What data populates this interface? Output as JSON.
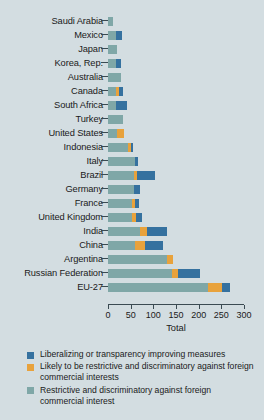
{
  "chart_data": {
    "type": "bar",
    "orientation": "horizontal",
    "stacked": true,
    "title": "",
    "xlabel": "Total",
    "ylabel": "",
    "xlim": [
      0,
      300
    ],
    "xticks": [
      0,
      50,
      100,
      150,
      200,
      250,
      300
    ],
    "grid": false,
    "legend_position": "bottom-left",
    "categories": [
      "Saudi Arabia",
      "Mexico",
      "Japan",
      "Korea, Rep.",
      "Australia",
      "Canada",
      "South Africa",
      "Turkey",
      "United States",
      "Indonesia",
      "Italy",
      "Brazil",
      "Germany",
      "France",
      "United Kingdom",
      "India",
      "China",
      "Argentina",
      "Russian Federation",
      "EU-27"
    ],
    "series": [
      {
        "name": "Restrictive and discriminatory against foreign commercial interest",
        "color": "#7fa7a7",
        "values": [
          11,
          17,
          20,
          17,
          28,
          17,
          17,
          33,
          20,
          44,
          59,
          57,
          57,
          53,
          53,
          70,
          59,
          130,
          141,
          220
        ]
      },
      {
        "name": "Likely to be restrictive and discriminatory against foreign commercial interests",
        "color": "#e8a23c",
        "values": [
          0,
          0,
          0,
          0,
          0,
          7,
          0,
          0,
          15,
          7,
          0,
          7,
          0,
          7,
          9,
          15,
          22,
          13,
          13,
          31
        ]
      },
      {
        "name": "Liberalizing or transparency improving measures",
        "color": "#35719f",
        "values": [
          0,
          13,
          0,
          11,
          0,
          9,
          24,
          0,
          0,
          4,
          7,
          40,
          13,
          9,
          13,
          46,
          40,
          0,
          48,
          18
        ]
      }
    ],
    "totals": [
      11,
      30,
      20,
      28,
      28,
      33,
      41,
      33,
      35,
      55,
      66,
      104,
      70,
      69,
      75,
      131,
      121,
      143,
      202,
      269
    ]
  },
  "legend": {
    "items": [
      {
        "label": "Liberalizing or transparency improving measures",
        "color": "#35719f",
        "swatch_name": "legend-swatch-liberalizing"
      },
      {
        "label": "Likely to be restrictive and discriminatory against foreign commercial interests",
        "color": "#e8a23c",
        "swatch_name": "legend-swatch-likely-restrictive"
      },
      {
        "label": "Restrictive and discriminatory against foreign commercial interest",
        "color": "#7fa7a7",
        "swatch_name": "legend-swatch-restrictive"
      }
    ]
  }
}
